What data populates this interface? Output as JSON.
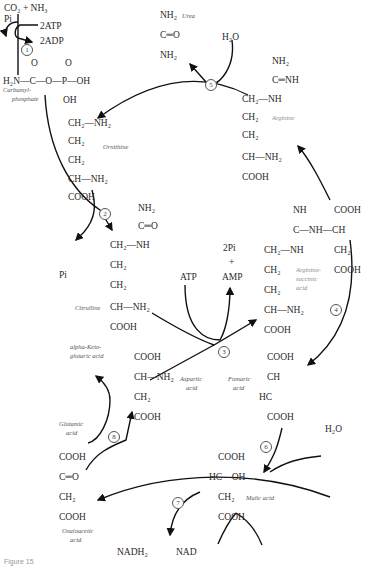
{
  "diagram": {
    "caption": "Figure 15",
    "steps": [
      "1",
      "2",
      "3",
      "4",
      "5",
      "6",
      "7",
      "8"
    ],
    "compounds": {
      "carbamyl_phosphate": {
        "name_line1": "Carbamyl-",
        "name_line2": "phosphate",
        "inputs": "CO₂ + NH₃",
        "pi": "Pi",
        "atp": "2ATP",
        "adp": "2ADP",
        "o1": "O",
        "o2": "O",
        "main": "H₂N—C—O—P—OH",
        "oh": "OH"
      },
      "urea": {
        "name": "Urea",
        "l1": "NH₂",
        "l2": "C═O",
        "l3": "NH₂",
        "water": "H₂O"
      },
      "arginine": {
        "name": "Arginine",
        "l1": "NH₂",
        "l2": "C═NH",
        "l3": "CH₂—NH",
        "l4": "CH₂",
        "l5": "CH₂",
        "l6": "CH—NH₂",
        "l7": "COOH"
      },
      "ornithine": {
        "name": "Ornithine",
        "l1": "CH₂—NH₂",
        "l2": "CH₂",
        "l3": "CH₂",
        "l4": "CH—NH₂",
        "l5": "COOH"
      },
      "citrulline": {
        "name": "Citrulline",
        "pi": "Pi",
        "l1": "NH₂",
        "l2": "C═O",
        "l3": "CH₂—NH",
        "l4": "CH₂",
        "l5": "CH₂",
        "l6": "CH—NH₂",
        "l7": "COOH"
      },
      "step3": {
        "atp": "ATP",
        "pi2": "2Pi",
        "plus": "+",
        "amp": "AMP"
      },
      "argininosuccinic_acid": {
        "name_l1": "Arginino-",
        "name_l2": "succinic",
        "name_l3": "acid",
        "nh": "NH",
        "c": "C—NH—CH",
        "cooh_top": "COOH",
        "ch2nh": "CH₂—NH",
        "ch2_r": "CH₂",
        "cooh_r": "COOH",
        "l4": "CH₂",
        "l5": "CH₂",
        "l6": "CH—NH₂",
        "l7": "COOH"
      },
      "aspartic_acid": {
        "name_l1": "Aspartic",
        "name_l2": "acid",
        "l1": "COOH",
        "l2": "CH—NH₂",
        "l3": "CH₂",
        "l4": "COOH"
      },
      "fumaric_acid": {
        "name_l1": "Fumaric",
        "name_l2": "acid",
        "l1": "COOH",
        "l2": "CH",
        "l3": "HC",
        "l4": "COOH"
      },
      "alpha_ketoglutaric": {
        "name_l1": "alpha-Keto-",
        "name_l2": "glutaric acid"
      },
      "glutamic_acid": {
        "name_l1": "Glutamic",
        "name_l2": "acid"
      },
      "malic_acid": {
        "name": "Malic acid",
        "water": "H₂O",
        "l1": "COOH",
        "l2": "HC—OH",
        "l3": "CH₂",
        "l4": "COOH"
      },
      "oxaloacetic_acid": {
        "name_l1": "Oxaloacetic",
        "name_l2": "acid",
        "l1": "COOH",
        "l2": "C═O",
        "l3": "CH₂",
        "l4": "COOH"
      },
      "step7": {
        "nadh2": "NADH₂",
        "nad": "NAD"
      }
    }
  }
}
